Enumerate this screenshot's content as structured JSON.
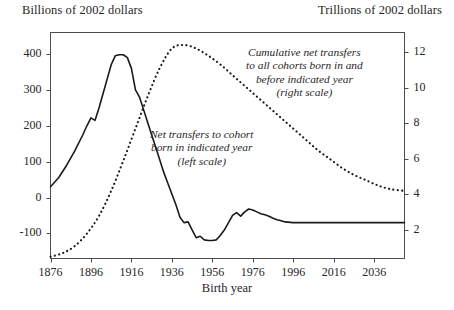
{
  "figure": {
    "left_unit_title": "Billions of 2002 dollars",
    "right_unit_title": "Trillions of 2002 dollars",
    "xaxis_title": "Birth year"
  },
  "annotations": {
    "cumulative": {
      "line1": "Cumulative net transfers",
      "line2": "to all cohorts born in and",
      "line3": "before indicated year",
      "line4": "(right scale)"
    },
    "cohort": {
      "line1": "Net transfers to cohort",
      "line2": "born in indicated year",
      "line3": "(left scale)"
    }
  },
  "chart_data": {
    "type": "line",
    "title": "",
    "xlabel": "Birth year",
    "ylabel": "Billions of 2002 dollars",
    "y2label": "Trillions of 2002 dollars",
    "grid": false,
    "legend": "inline-annotations",
    "xlim": [
      1876,
      2051
    ],
    "ylim_left": [
      -170,
      460
    ],
    "ylim_right": [
      0.4,
      13.1
    ],
    "xticks": [
      1876,
      1896,
      1916,
      1936,
      1956,
      1976,
      1996,
      2016,
      2036
    ],
    "yticks_left": [
      400,
      300,
      200,
      100,
      0,
      -100
    ],
    "yticks_right": [
      12,
      10,
      8,
      6,
      4,
      2
    ],
    "series": [
      {
        "name": "Net transfers to cohort born in indicated year",
        "axis": "left",
        "style": "solid",
        "units": "Billions of 2002 dollars",
        "x": [
          1876,
          1880,
          1884,
          1888,
          1892,
          1894,
          1896,
          1898,
          1900,
          1902,
          1904,
          1906,
          1908,
          1910,
          1912,
          1914,
          1916,
          1918,
          1920,
          1922,
          1924,
          1926,
          1928,
          1930,
          1932,
          1934,
          1936,
          1938,
          1940,
          1942,
          1944,
          1946,
          1948,
          1950,
          1952,
          1954,
          1956,
          1958,
          1960,
          1962,
          1964,
          1966,
          1968,
          1970,
          1972,
          1974,
          1976,
          1978,
          1980,
          1982,
          1984,
          1986,
          1988,
          1990,
          1992,
          1996,
          2000,
          2006,
          2012,
          2020,
          2030,
          2040,
          2051
        ],
        "y": [
          30,
          55,
          90,
          130,
          175,
          200,
          222,
          215,
          250,
          290,
          330,
          370,
          395,
          398,
          398,
          390,
          360,
          300,
          280,
          245,
          210,
          175,
          140,
          105,
          70,
          40,
          10,
          -20,
          -55,
          -70,
          -68,
          -90,
          -112,
          -108,
          -118,
          -120,
          -120,
          -118,
          -105,
          -90,
          -70,
          -50,
          -42,
          -52,
          -40,
          -32,
          -35,
          -40,
          -45,
          -48,
          -52,
          -58,
          -62,
          -65,
          -68,
          -70,
          -70,
          -70,
          -70,
          -70,
          -70,
          -70,
          -70
        ]
      },
      {
        "name": "Cumulative net transfers to all cohorts born in and before indicated year",
        "axis": "right",
        "style": "dotted",
        "units": "Trillions of 2002 dollars",
        "x": [
          1876,
          1882,
          1888,
          1894,
          1900,
          1906,
          1912,
          1918,
          1924,
          1930,
          1936,
          1942,
          1948,
          1954,
          1960,
          1966,
          1972,
          1978,
          1984,
          1990,
          1996,
          2002,
          2008,
          2014,
          2020,
          2026,
          2032,
          2038,
          2044,
          2051
        ],
        "y": [
          0.5,
          0.7,
          1.1,
          1.8,
          2.8,
          4.2,
          5.9,
          7.7,
          9.5,
          11.1,
          12.2,
          12.4,
          12.2,
          11.8,
          11.3,
          10.7,
          10.1,
          9.5,
          8.9,
          8.3,
          7.7,
          7.1,
          6.5,
          6.0,
          5.5,
          5.1,
          4.8,
          4.5,
          4.3,
          4.2
        ]
      }
    ]
  },
  "colors": {
    "line": "#1a1a1a",
    "axis": "#4d4d4d",
    "text": "#262626",
    "background": "#ffffff"
  }
}
